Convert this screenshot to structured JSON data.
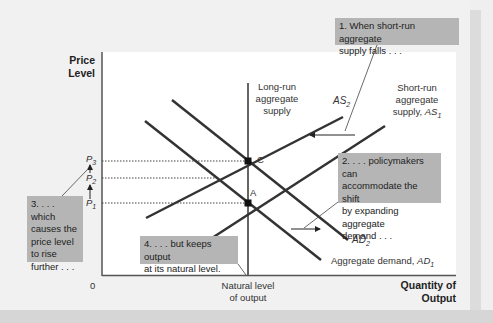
{
  "axes": {
    "y_title_line1": "Price",
    "y_title_line2": "Level",
    "x_title_line1": "Quantity of",
    "x_title_line2": "Output",
    "origin": "0",
    "x_tick_line1": "Natural level",
    "x_tick_line2": "of output",
    "y_ticks": [
      {
        "base": "P",
        "sub": "3"
      },
      {
        "base": "P",
        "sub": "2"
      },
      {
        "base": "P",
        "sub": "1"
      }
    ]
  },
  "curves": {
    "lras_line1": "Long-run",
    "lras_line2": "aggregate",
    "lras_line3": "supply",
    "as2_base": "AS",
    "as2_sub": "2",
    "as1_line1": "Short-run",
    "as1_line2": "aggregate",
    "as1_line3_text": "supply, ",
    "as1_base": "AS",
    "as1_sub": "1",
    "ad2_base": "AD",
    "ad2_sub": "2",
    "ad1_text": "Aggregate demand, ",
    "ad1_base": "AD",
    "ad1_sub": "1"
  },
  "points": {
    "c": "C",
    "a": "A"
  },
  "notes": {
    "n1_line1": "1. When short-run aggregate",
    "n1_line2": "supply falls . . .",
    "n2_line1": "2. . . . policymakers can",
    "n2_line2": "accommodate the shift",
    "n2_line3": "by expanding aggregate",
    "n2_line4": "demand . . .",
    "n3_line1": "3. . . . which",
    "n3_line2": "causes the",
    "n3_line3": "price level",
    "n3_line4": "to rise",
    "n3_line5": "further . . .",
    "n4_line1": "4. . . . but keeps output",
    "n4_line2": "at its natural level."
  },
  "colors": {
    "background": "#efefef",
    "plot": "#ffffff",
    "curve": "#333333",
    "note_fill": "#b5b5b5"
  }
}
